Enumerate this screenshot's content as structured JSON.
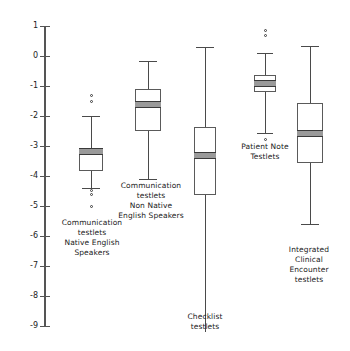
{
  "chart_data": {
    "type": "box",
    "title": "",
    "xlabel": "",
    "ylabel": "",
    "ylim": [
      -9,
      1
    ],
    "grid": false,
    "legend": null,
    "y_ticks": [
      1,
      0,
      -1,
      -2,
      -3,
      -4,
      -5,
      -6,
      -7,
      -8,
      -9
    ],
    "y_tick_labels": [
      "1",
      "0",
      "-1",
      "-2",
      "-3",
      "-4",
      "-5",
      "-6",
      "-7",
      "-8",
      "-9"
    ],
    "categories": [
      "Communication testlets Native English Speakers",
      "Communication testlets Non Native English Speakers",
      "Checklist testlets",
      "Patient Note Testlets",
      "Integrated Clinical Encounter testlets"
    ],
    "boxes": [
      {
        "name": "Communication testlets Native English Speakers",
        "whisker_high": -2.0,
        "q3": -3.07,
        "median": -3.17,
        "q1": -3.83,
        "whisker_low": -4.4,
        "outliers": [
          -1.3,
          -1.5,
          -4.47,
          -4.6,
          -5.0
        ]
      },
      {
        "name": "Communication testlets Non Native English Speakers",
        "whisker_high": -0.15,
        "q3": -1.1,
        "median": -1.6,
        "q1": -2.5,
        "whisker_low": -4.1,
        "outliers": []
      },
      {
        "name": "Checklist testlets",
        "whisker_high": 0.3,
        "q3": -2.37,
        "median": -3.3,
        "q1": -4.63,
        "whisker_low": -9.2,
        "outliers": []
      },
      {
        "name": "Patient Note Testlets",
        "whisker_high": 0.1,
        "q3": -0.63,
        "median": -0.9,
        "q1": -1.2,
        "whisker_low": -2.57,
        "outliers": [
          0.85,
          0.67,
          -2.77
        ]
      },
      {
        "name": "Integrated Clinical Encounter testlets",
        "whisker_high": 0.35,
        "q3": -1.55,
        "median": -2.57,
        "q1": -3.57,
        "whisker_low": -5.6,
        "outliers": []
      }
    ]
  },
  "axis": {
    "tick_labels": [
      "1",
      "0",
      "-1",
      "-2",
      "-3",
      "-4",
      "-5",
      "-6",
      "-7",
      "-8",
      "-9"
    ]
  },
  "labels": {
    "cat1_line1": "Communication",
    "cat1_line2": "testlets",
    "cat1_line3": "Native English",
    "cat1_line4": "Speakers",
    "cat2_line1": "Communication",
    "cat2_line2": "testlets",
    "cat2_line3": "Non Native",
    "cat2_line4": "English Speakers",
    "cat3_line1": "Checklist",
    "cat3_line2": "testlets",
    "cat4_line1": "Patient Note",
    "cat4_line2": "Testlets",
    "cat5_line1": "Integrated",
    "cat5_line2": "Clinical",
    "cat5_line3": "Encounter",
    "cat5_line4": "testlets"
  },
  "colors": {
    "axis": "#555555",
    "box_edge": "#5a5a5a",
    "median_fill": "#9a9a9a",
    "background": "#ffffff"
  }
}
